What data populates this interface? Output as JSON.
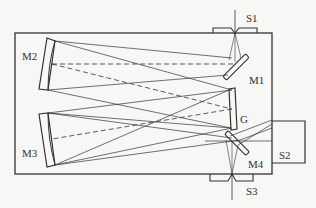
{
  "diagram": {
    "colors": {
      "line": "#333333",
      "background": "#f7f7f5"
    },
    "labels": {
      "s1": "S1",
      "s2": "S2",
      "s3": "S3",
      "m1": "M1",
      "m2": "M2",
      "m3": "M3",
      "m4": "M4",
      "g": "G"
    },
    "components": [
      {
        "id": "S1",
        "type": "entrance-slit"
      },
      {
        "id": "M1",
        "type": "plane-mirror"
      },
      {
        "id": "M2",
        "type": "concave-mirror"
      },
      {
        "id": "G",
        "type": "grating"
      },
      {
        "id": "M3",
        "type": "concave-mirror"
      },
      {
        "id": "M4",
        "type": "plane-mirror"
      },
      {
        "id": "S2",
        "type": "detector-port"
      },
      {
        "id": "S3",
        "type": "exit-slit"
      }
    ]
  }
}
